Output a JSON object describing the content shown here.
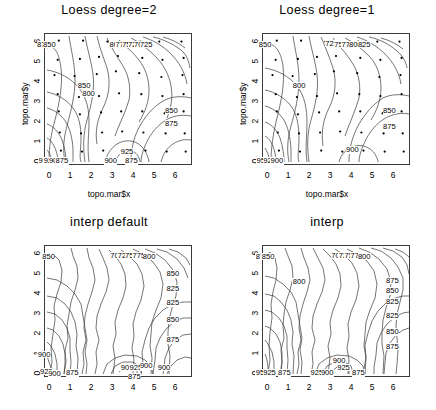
{
  "figure": {
    "type": "contour-plot-grid",
    "rows": 2,
    "cols": 2,
    "dataset": "topo.mar",
    "contour_interval": 25,
    "contour_levels": [
      700,
      725,
      750,
      775,
      800,
      825,
      850,
      875,
      900,
      925,
      950
    ],
    "background": "#ffffff",
    "line_color": "#3a3a3a",
    "point_color": "#000000"
  },
  "chart_data": [
    {
      "id": "loess-degree-2",
      "type": "contour",
      "title": "Loess  degree=2",
      "xlabel": "topo.mar$x",
      "ylabel": "topo.mar$y",
      "xlim": [
        -0.35,
        6.55
      ],
      "ylim": [
        -0.35,
        6.45
      ],
      "xticks": [
        "0",
        "1",
        "2",
        "3",
        "4",
        "5",
        "6"
      ],
      "yticks": [
        "0",
        "1",
        "2",
        "3",
        "4",
        "5",
        "6"
      ],
      "grid": false,
      "show_points": true,
      "smooth": true,
      "labels": [
        {
          "text": "875",
          "x": 0.5,
          "y": 91
        },
        {
          "text": "850",
          "x": 4.5,
          "y": 91
        },
        {
          "text": "800",
          "x": 49.5,
          "y": 91
        },
        {
          "text": "775",
          "x": 53.5,
          "y": 91
        },
        {
          "text": "750",
          "x": 58.0,
          "y": 91
        },
        {
          "text": "725",
          "x": 62.0,
          "y": 91
        },
        {
          "text": "700",
          "x": 66.0,
          "y": 91
        },
        {
          "text": "725",
          "x": 70.0,
          "y": 91
        },
        {
          "text": "850",
          "x": 28.0,
          "y": 60
        },
        {
          "text": "800",
          "x": 31.0,
          "y": 54
        },
        {
          "text": "850",
          "x": 87.0,
          "y": 41
        },
        {
          "text": "875",
          "x": 87.0,
          "y": 31
        },
        {
          "text": "925",
          "x": 57.0,
          "y": 10
        },
        {
          "text": "950",
          "x": 1.5,
          "y": 3
        },
        {
          "text": "925",
          "x": 5.0,
          "y": 3
        },
        {
          "text": "900",
          "x": 8.5,
          "y": 3
        },
        {
          "text": "875",
          "x": 13.0,
          "y": 3
        },
        {
          "text": "900",
          "x": 46.0,
          "y": 3
        },
        {
          "text": "875",
          "x": 60.0,
          "y": 3
        }
      ],
      "points": [
        [
          0.3,
          6.1
        ],
        [
          1.45,
          6.1
        ],
        [
          2.6,
          6.05
        ],
        [
          3.35,
          5.95
        ],
        [
          4.15,
          6.05
        ],
        [
          5.05,
          6.05
        ],
        [
          6.1,
          6.05
        ],
        [
          0.25,
          5.1
        ],
        [
          1.3,
          5.15
        ],
        [
          2.2,
          5.25
        ],
        [
          3.1,
          5.3
        ],
        [
          4.25,
          5.2
        ],
        [
          5.2,
          5.1
        ],
        [
          6.2,
          5.2
        ],
        [
          0.1,
          4.3
        ],
        [
          1.05,
          4.25
        ],
        [
          2.1,
          4.35
        ],
        [
          3.0,
          4.5
        ],
        [
          4.1,
          4.4
        ],
        [
          5.15,
          4.2
        ],
        [
          6.15,
          4.3
        ],
        [
          0.25,
          3.3
        ],
        [
          1.25,
          3.15
        ],
        [
          2.2,
          3.2
        ],
        [
          3.15,
          3.35
        ],
        [
          4.2,
          3.3
        ],
        [
          5.2,
          3.2
        ],
        [
          6.2,
          3.3
        ],
        [
          0.3,
          2.4
        ],
        [
          1.3,
          2.25
        ],
        [
          2.3,
          2.35
        ],
        [
          3.25,
          2.4
        ],
        [
          4.25,
          2.4
        ],
        [
          5.3,
          2.3
        ],
        [
          6.2,
          2.4
        ],
        [
          0.35,
          1.3
        ],
        [
          1.35,
          1.25
        ],
        [
          2.35,
          1.3
        ],
        [
          3.3,
          1.35
        ],
        [
          4.3,
          1.3
        ],
        [
          5.35,
          1.25
        ],
        [
          6.25,
          1.25
        ],
        [
          0.4,
          0.35
        ],
        [
          1.4,
          0.3
        ],
        [
          2.4,
          0.35
        ],
        [
          3.4,
          0.3
        ],
        [
          4.4,
          0.35
        ],
        [
          5.4,
          0.3
        ],
        [
          6.3,
          0.3
        ]
      ]
    },
    {
      "id": "loess-degree-1",
      "type": "contour",
      "title": "Loess  degree=1",
      "xlabel": "topo.mar$x",
      "ylabel": "topo.mar$y",
      "xlim": [
        -0.35,
        6.55
      ],
      "ylim": [
        -0.35,
        6.45
      ],
      "xticks": [
        "0",
        "1",
        "2",
        "3",
        "4",
        "5",
        "6"
      ],
      "yticks": [
        "0",
        "1",
        "2",
        "3",
        "4",
        "5",
        "6"
      ],
      "grid": false,
      "show_points": true,
      "smooth": true,
      "labels": [
        {
          "text": "850",
          "x": 3.0,
          "y": 91
        },
        {
          "text": "725",
          "x": 48.0,
          "y": 92
        },
        {
          "text": "750",
          "x": 54.0,
          "y": 91
        },
        {
          "text": "775",
          "x": 59.0,
          "y": 91
        },
        {
          "text": "800",
          "x": 64.0,
          "y": 91
        },
        {
          "text": "825",
          "x": 70.0,
          "y": 91
        },
        {
          "text": "800",
          "x": 26.0,
          "y": 60
        },
        {
          "text": "850",
          "x": 87.0,
          "y": 41
        },
        {
          "text": "875",
          "x": 87.0,
          "y": 29
        },
        {
          "text": "900",
          "x": 62.0,
          "y": 11
        },
        {
          "text": "950",
          "x": 1.5,
          "y": 3
        },
        {
          "text": "925",
          "x": 6.0,
          "y": 3
        },
        {
          "text": "900",
          "x": 11.0,
          "y": 3
        }
      ],
      "points": [
        [
          0.3,
          6.1
        ],
        [
          1.45,
          6.1
        ],
        [
          2.6,
          6.05
        ],
        [
          3.35,
          5.95
        ],
        [
          4.15,
          6.05
        ],
        [
          5.05,
          6.05
        ],
        [
          6.1,
          6.05
        ],
        [
          0.25,
          5.1
        ],
        [
          1.3,
          5.15
        ],
        [
          2.2,
          5.25
        ],
        [
          3.1,
          5.3
        ],
        [
          4.25,
          5.2
        ],
        [
          5.2,
          5.1
        ],
        [
          6.2,
          5.2
        ],
        [
          0.1,
          4.3
        ],
        [
          1.05,
          4.25
        ],
        [
          2.1,
          4.35
        ],
        [
          3.0,
          4.5
        ],
        [
          4.1,
          4.4
        ],
        [
          5.15,
          4.2
        ],
        [
          6.15,
          4.3
        ],
        [
          0.25,
          3.3
        ],
        [
          1.25,
          3.15
        ],
        [
          2.2,
          3.2
        ],
        [
          3.15,
          3.35
        ],
        [
          4.2,
          3.3
        ],
        [
          5.2,
          3.2
        ],
        [
          6.2,
          3.3
        ],
        [
          0.3,
          2.4
        ],
        [
          1.3,
          2.25
        ],
        [
          2.3,
          2.35
        ],
        [
          3.25,
          2.4
        ],
        [
          4.25,
          2.4
        ],
        [
          5.3,
          2.3
        ],
        [
          6.2,
          2.4
        ],
        [
          0.35,
          1.3
        ],
        [
          1.35,
          1.25
        ],
        [
          2.35,
          1.3
        ],
        [
          3.3,
          1.35
        ],
        [
          4.3,
          1.3
        ],
        [
          5.35,
          1.25
        ],
        [
          6.25,
          1.25
        ],
        [
          0.4,
          0.35
        ],
        [
          1.4,
          0.3
        ],
        [
          2.4,
          0.35
        ],
        [
          3.4,
          0.3
        ],
        [
          4.4,
          0.35
        ],
        [
          5.4,
          0.3
        ],
        [
          6.3,
          0.3
        ]
      ]
    },
    {
      "id": "interp-default",
      "type": "contour",
      "title": "interp  default",
      "xlabel": "",
      "ylabel": "",
      "xlim": [
        -0.35,
        6.55
      ],
      "ylim": [
        -0.35,
        6.45
      ],
      "xticks": [
        "0",
        "1",
        "2",
        "3",
        "4",
        "5",
        "6"
      ],
      "yticks": [
        "0",
        "1",
        "2",
        "3",
        "4",
        "5",
        "6"
      ],
      "grid": false,
      "show_points": false,
      "smooth": false,
      "labels": [
        {
          "text": "850",
          "x": 4.0,
          "y": 91
        },
        {
          "text": "700",
          "x": 50.0,
          "y": 92
        },
        {
          "text": "725",
          "x": 55.0,
          "y": 92
        },
        {
          "text": "750",
          "x": 60.0,
          "y": 92
        },
        {
          "text": "775",
          "x": 65.0,
          "y": 92
        },
        {
          "text": "800",
          "x": 72.0,
          "y": 91
        },
        {
          "text": "850",
          "x": 88.0,
          "y": 78
        },
        {
          "text": "825",
          "x": 88.0,
          "y": 67
        },
        {
          "text": "825",
          "x": 88.0,
          "y": 56
        },
        {
          "text": "850",
          "x": 88.0,
          "y": 43
        },
        {
          "text": "875",
          "x": 88.0,
          "y": 28
        },
        {
          "text": "900",
          "x": 1.0,
          "y": 17
        },
        {
          "text": "925",
          "x": 2.5,
          "y": 4
        },
        {
          "text": "900",
          "x": 8.0,
          "y": 2
        },
        {
          "text": "875",
          "x": 20.0,
          "y": 3
        },
        {
          "text": "900",
          "x": 57.0,
          "y": 7
        },
        {
          "text": "925",
          "x": 63.0,
          "y": 7
        },
        {
          "text": "900",
          "x": 70.0,
          "y": 8
        },
        {
          "text": "900",
          "x": 82.0,
          "y": 7
        },
        {
          "text": "875",
          "x": 62.0,
          "y": 0
        }
      ],
      "points": []
    },
    {
      "id": "interp",
      "type": "contour",
      "title": "interp",
      "xlabel": "",
      "ylabel": "",
      "xlim": [
        -0.35,
        6.55
      ],
      "ylim": [
        -0.35,
        6.45
      ],
      "xticks": [
        "0",
        "1",
        "2",
        "3",
        "4",
        "5",
        "6"
      ],
      "yticks": [
        "0",
        "1",
        "2",
        "3",
        "4",
        "5",
        "6"
      ],
      "grid": false,
      "show_points": false,
      "smooth": false,
      "labels": [
        {
          "text": "875",
          "x": 1.0,
          "y": 91
        },
        {
          "text": "850",
          "x": 5.0,
          "y": 91
        },
        {
          "text": "700",
          "x": 52.0,
          "y": 92
        },
        {
          "text": "725",
          "x": 57.0,
          "y": 92
        },
        {
          "text": "750",
          "x": 61.0,
          "y": 92
        },
        {
          "text": "775",
          "x": 65.0,
          "y": 92
        },
        {
          "text": "800",
          "x": 70.0,
          "y": 91
        },
        {
          "text": "800",
          "x": 26.0,
          "y": 72
        },
        {
          "text": "875",
          "x": 89.0,
          "y": 73
        },
        {
          "text": "850",
          "x": 89.0,
          "y": 65
        },
        {
          "text": "825",
          "x": 89.0,
          "y": 57
        },
        {
          "text": "825",
          "x": 89.0,
          "y": 46
        },
        {
          "text": "850",
          "x": 89.0,
          "y": 34
        },
        {
          "text": "875",
          "x": 89.0,
          "y": 23
        },
        {
          "text": "900",
          "x": 53.0,
          "y": 12
        },
        {
          "text": "925",
          "x": 56.0,
          "y": 7
        },
        {
          "text": "950",
          "x": 1.0,
          "y": 3
        },
        {
          "text": "925",
          "x": 6.0,
          "y": 3
        },
        {
          "text": "875",
          "x": 16.0,
          "y": 3
        },
        {
          "text": "925",
          "x": 38.0,
          "y": 3
        },
        {
          "text": "900",
          "x": 45.0,
          "y": 3
        },
        {
          "text": "875",
          "x": 66.0,
          "y": 3
        }
      ],
      "points": []
    }
  ]
}
